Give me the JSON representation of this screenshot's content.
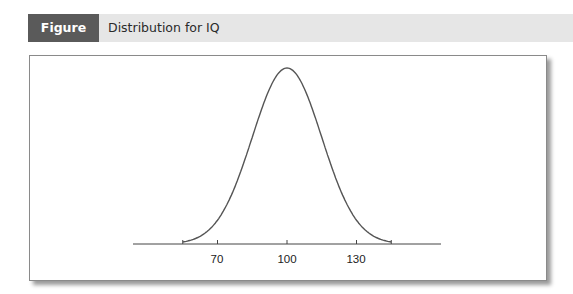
{
  "figure": {
    "label": "Figure 5.2",
    "title": "Distribution for IQ"
  },
  "chart_data": {
    "type": "line",
    "title": "Distribution for IQ",
    "xlabel": "",
    "ylabel": "",
    "mean": 100,
    "sd": 15,
    "xlim": [
      40,
      160
    ],
    "x_ticks": [
      55,
      70,
      100,
      130,
      145
    ],
    "tick_labels": [
      "70",
      "100",
      "130"
    ],
    "grid": false,
    "legend": "none"
  },
  "axis": {
    "ticks": [
      {
        "label": ""
      },
      {
        "label": "70"
      },
      {
        "label": "100"
      },
      {
        "label": "130"
      },
      {
        "label": ""
      }
    ]
  },
  "colors": {
    "label_bg": "#5a5a5a",
    "header_bg": "#e6e6e6",
    "curve": "#555555"
  }
}
